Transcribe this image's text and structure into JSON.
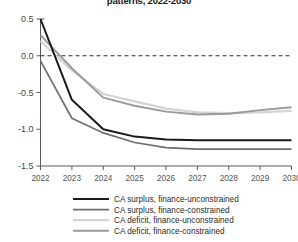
{
  "chart_data": {
    "type": "line",
    "title": "patterns, 2022-2030",
    "xlabel": "",
    "ylabel": "",
    "x": [
      2022,
      2023,
      2024,
      2025,
      2026,
      2027,
      2028,
      2029,
      2030
    ],
    "xtick_labels": [
      "2022",
      "2023",
      "2024",
      "2025",
      "2026",
      "2027",
      "2028",
      "2029",
      "2030"
    ],
    "ytick_labels": [
      "0.5",
      "0.0",
      "-0.5",
      "-1.0",
      "-1.5"
    ],
    "ytick_values": [
      0.5,
      0.0,
      -0.5,
      -1.0,
      -1.5
    ],
    "ylim": [
      -1.5,
      0.5
    ],
    "xlim": [
      2022,
      2030
    ],
    "grid": false,
    "legend_position": "bottom",
    "zero_reference_line": 0.0,
    "series": [
      {
        "name": "CA surplus, finance-unconstrained",
        "color": "#1a1a1a",
        "width": 2.0,
        "values": [
          0.5,
          -0.6,
          -1.0,
          -1.1,
          -1.14,
          -1.15,
          -1.15,
          -1.15,
          -1.15
        ]
      },
      {
        "name": "CA surplus, finance-constrained",
        "color": "#6e6e6e",
        "width": 1.7,
        "values": [
          -0.07,
          -0.85,
          -1.05,
          -1.18,
          -1.25,
          -1.27,
          -1.27,
          -1.27,
          -1.27
        ]
      },
      {
        "name": "CA deficit, finance-unconstrained",
        "color": "#d4d4d4",
        "width": 2.2,
        "values": [
          0.2,
          -0.2,
          -0.52,
          -0.62,
          -0.72,
          -0.77,
          -0.78,
          -0.77,
          -0.75
        ]
      },
      {
        "name": "CA deficit, finance-constrained",
        "color": "#9a9a9a",
        "width": 1.9,
        "values": [
          0.28,
          -0.17,
          -0.57,
          -0.68,
          -0.76,
          -0.8,
          -0.79,
          -0.74,
          -0.7
        ]
      }
    ]
  },
  "legend": {
    "items": [
      {
        "label": "CA surplus, finance-unconstrained",
        "color": "#1a1a1a",
        "width": 2.0
      },
      {
        "label": "CA surplus, finance-constrained",
        "color": "#6e6e6e",
        "width": 1.7
      },
      {
        "label": "CA deficit, finance-unconstrained",
        "color": "#d4d4d4",
        "width": 2.2
      },
      {
        "label": "CA deficit, finance-constrained",
        "color": "#9a9a9a",
        "width": 1.9
      }
    ]
  }
}
